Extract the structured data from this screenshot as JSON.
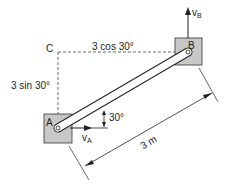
{
  "diagram": {
    "points": {
      "A": "A",
      "B": "B",
      "C": "C"
    },
    "labels": {
      "horizontal": "3 cos 30°",
      "vertical": "3 sin 30°",
      "angle": "30°",
      "length": "3 m",
      "velocity_a": "v",
      "velocity_a_sub": "A",
      "velocity_b": "v",
      "velocity_b_sub": "B"
    },
    "colors": {
      "block_fill": "#c8c8c8",
      "line": "#222222"
    }
  }
}
